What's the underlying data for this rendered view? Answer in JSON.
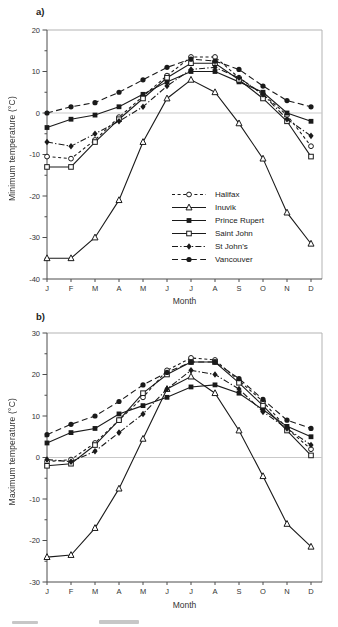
{
  "figure": {
    "panel_a_label": "a)",
    "panel_b_label": "b)"
  },
  "colors": {
    "series": "#1a1a1a",
    "zero_line": "#c9c9c9",
    "plot_border": "#b3b3b3",
    "axis": "#4d4d4d",
    "text": "#333333",
    "background": "#ffffff"
  },
  "chart_data": [
    {
      "type": "line",
      "panel": "a",
      "title": "",
      "ylabel": "Minimum temperature (°C)",
      "xlabel": "Month",
      "x_categories": [
        "J",
        "F",
        "M",
        "A",
        "M",
        "J",
        "J",
        "A",
        "S",
        "O",
        "N",
        "D"
      ],
      "ylim": [
        -40,
        20
      ],
      "yticks_major": [
        20,
        10,
        0,
        -10,
        -20,
        -30,
        -40
      ],
      "ytick_minor_step": 5,
      "zero_gridline": true,
      "grid": "zero-line-only",
      "legend_position": "inside-lower-right",
      "series": [
        {
          "name": "Halifax",
          "line": "dash",
          "marker": "circle-open",
          "values": [
            -10.5,
            -11,
            -6.5,
            -1,
            4,
            9,
            13.5,
            13.5,
            8.5,
            4.5,
            -0.5,
            -8
          ]
        },
        {
          "name": "Inuvik",
          "line": "solid",
          "marker": "triangle-open",
          "values": [
            -35,
            -35,
            -30,
            -21,
            -7,
            3.5,
            8,
            5,
            -2.5,
            -11,
            -24,
            -31.5
          ]
        },
        {
          "name": "Prince Rupert",
          "line": "solid",
          "marker": "square-filled",
          "values": [
            -3.5,
            -1.5,
            -0.5,
            1.5,
            4.5,
            7.5,
            10,
            10,
            7.5,
            5,
            0,
            -2
          ]
        },
        {
          "name": "Saint John",
          "line": "solid",
          "marker": "square-open",
          "values": [
            -13,
            -13,
            -7,
            -1.5,
            3.5,
            8.5,
            12,
            12,
            8,
            3.5,
            -2,
            -10.5
          ]
        },
        {
          "name": "St John's",
          "line": "dashdot",
          "marker": "diamond-filled",
          "values": [
            -7,
            -8,
            -5,
            -2,
            1.5,
            6.5,
            10.5,
            11,
            8.5,
            4.5,
            -1.5,
            -5.5
          ]
        },
        {
          "name": "Vancouver",
          "line": "longdash",
          "marker": "circle-filled",
          "values": [
            0,
            1.5,
            2.5,
            5,
            8,
            11,
            13,
            12.5,
            10.5,
            6.5,
            3,
            1.5
          ]
        }
      ]
    },
    {
      "type": "line",
      "panel": "b",
      "title": "",
      "ylabel": "Maximum temperature (°C)",
      "xlabel": "Month",
      "x_categories": [
        "J",
        "F",
        "M",
        "A",
        "M",
        "J",
        "J",
        "A",
        "S",
        "O",
        "N",
        "D"
      ],
      "ylim": [
        -30,
        30
      ],
      "yticks_major": [
        30,
        20,
        10,
        0,
        -10,
        -20,
        -30
      ],
      "ytick_minor_step": 5,
      "zero_gridline": true,
      "grid": "zero-line-only",
      "legend_position": "none",
      "series": [
        {
          "name": "Halifax",
          "line": "dash",
          "marker": "circle-open",
          "values": [
            -1,
            -0.5,
            3.5,
            9,
            14.5,
            21,
            24,
            23.5,
            18.5,
            13.5,
            7,
            2
          ]
        },
        {
          "name": "Inuvik",
          "line": "solid",
          "marker": "triangle-open",
          "values": [
            -24,
            -23.5,
            -17,
            -7.5,
            4.5,
            16.5,
            19.5,
            15.5,
            6.5,
            -4.5,
            -16,
            -21.5
          ]
        },
        {
          "name": "Prince Rupert",
          "line": "solid",
          "marker": "square-filled",
          "values": [
            3.5,
            6,
            7,
            10.5,
            12.5,
            14.5,
            17,
            17.5,
            15.5,
            11.5,
            7.5,
            5
          ]
        },
        {
          "name": "Saint John",
          "line": "solid",
          "marker": "square-open",
          "values": [
            -2,
            -1.5,
            3,
            9,
            15.5,
            20,
            23,
            23,
            18,
            12.5,
            6.5,
            0.5
          ]
        },
        {
          "name": "St John's",
          "line": "dashdot",
          "marker": "diamond-filled",
          "values": [
            -0.5,
            -1,
            1.5,
            6,
            10.5,
            16.5,
            21,
            20,
            16.5,
            11,
            7,
            3
          ]
        },
        {
          "name": "Vancouver",
          "line": "longdash",
          "marker": "circle-filled",
          "values": [
            5.5,
            8,
            10,
            13.5,
            17.5,
            20.5,
            23,
            23,
            19,
            14,
            9,
            7
          ]
        }
      ]
    }
  ]
}
